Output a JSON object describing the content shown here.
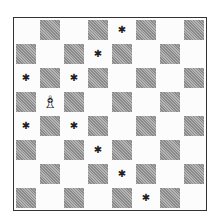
{
  "diagram": {
    "type": "chess-board",
    "orientation": "white-at-bottom",
    "files": [
      "a",
      "b",
      "c",
      "d",
      "e",
      "f",
      "g",
      "h"
    ],
    "ranks": [
      8,
      7,
      6,
      5,
      4,
      3,
      2,
      1
    ],
    "pieces": [
      {
        "square": "b5",
        "piece": "white-bishop",
        "glyph": "♗"
      }
    ],
    "markers": [
      {
        "square": "e8",
        "glyph": "✱"
      },
      {
        "square": "d7",
        "glyph": "✱"
      },
      {
        "square": "a6",
        "glyph": "✱"
      },
      {
        "square": "c6",
        "glyph": "✱"
      },
      {
        "square": "a4",
        "glyph": "✱"
      },
      {
        "square": "c4",
        "glyph": "✱"
      },
      {
        "square": "d3",
        "glyph": "✱"
      },
      {
        "square": "e2",
        "glyph": "✱"
      },
      {
        "square": "f1",
        "glyph": "✱"
      }
    ],
    "colors": {
      "dark_square": "#9e9e9e",
      "light_square": "#fcfcfc",
      "border": "#333333"
    }
  }
}
